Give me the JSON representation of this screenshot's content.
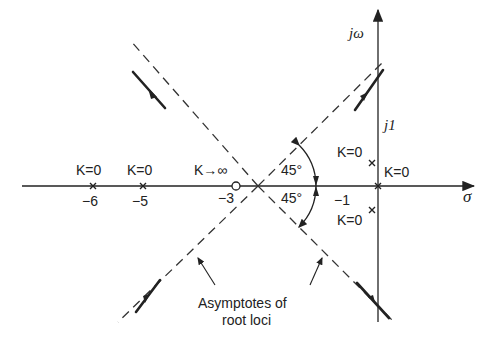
{
  "diagram": {
    "type": "root-locus",
    "axes": {
      "real_axis_label": "σ",
      "imag_axis_label": "jω",
      "imag_tick_label": "j1"
    },
    "real_axis_ticks": [
      "-6",
      "-5",
      "-3",
      "-1"
    ],
    "poles": [
      {
        "location": "-6",
        "label": "K=0"
      },
      {
        "location": "-5",
        "label": "K=0"
      },
      {
        "location": "0",
        "label": "K=0"
      },
      {
        "location": "-1+j1",
        "label": "K=0"
      },
      {
        "location": "-1-j1",
        "label": "K=0"
      }
    ],
    "zeros": [
      {
        "location": "-3",
        "label": "K→∞"
      }
    ],
    "angles": [
      "45°",
      "45°"
    ],
    "annotation": {
      "line1": "Asymptotes of",
      "line2": "root loci"
    }
  },
  "labels": {
    "k0_m6": "K=0",
    "k0_m5": "K=0",
    "kinf": "K→∞",
    "m6": "−6",
    "m5": "−5",
    "m3": "−3",
    "m1": "−1",
    "k0_origin": "K=0",
    "k0_upper": "K=0",
    "k0_lower": "K=0",
    "angle_upper": "45°",
    "angle_lower": "45°",
    "sigma": "σ",
    "jw": "jω",
    "j1": "j1",
    "asym1": "Asymptotes of",
    "asym2": "root loci"
  }
}
